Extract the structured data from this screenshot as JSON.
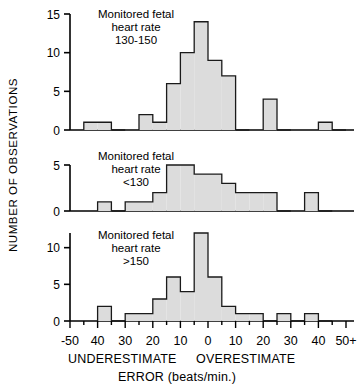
{
  "figure": {
    "ylabel": "NUMBER OF OBSERVATIONS",
    "xaxis_title": "ERROR (beats/min.)",
    "left_caption": "UNDERESTIMATE",
    "right_caption": "OVERESTIMATE",
    "xtick_labels": [
      "-50",
      "40",
      "30",
      "20",
      "10",
      "0",
      "10",
      "20",
      "30",
      "40",
      "50+"
    ],
    "bar_fill": "#dcdcdc",
    "bar_stroke": "#1a1a1a",
    "axis_color": "#000000"
  },
  "chart_data": {
    "type": "bar",
    "xlabel": "ERROR (beats/min.)",
    "ylabel": "NUMBER OF OBSERVATIONS",
    "xlim": [
      -50,
      50
    ],
    "bin_width": 5,
    "grid": false,
    "legend": "none",
    "panels": [
      {
        "id": "panel-130-150",
        "title_lines": [
          "Monitored fetal",
          "heart rate",
          "130-150"
        ],
        "ylim": [
          0,
          15
        ],
        "yticks": [
          0,
          5,
          10,
          15
        ],
        "bin_left_edges": [
          -50,
          -45,
          -40,
          -35,
          -30,
          -25,
          -20,
          -15,
          -10,
          -5,
          0,
          5,
          10,
          15,
          20,
          25,
          30,
          35,
          40,
          45
        ],
        "values": [
          0,
          1,
          1,
          0,
          0,
          2,
          1,
          6,
          10,
          14,
          9,
          7,
          0,
          0,
          4,
          0,
          0,
          0,
          1,
          0
        ]
      },
      {
        "id": "panel-under-130",
        "title_lines": [
          "Monitored fetal",
          "heart rate",
          "<130"
        ],
        "ylim": [
          0,
          5
        ],
        "yticks": [
          0,
          5
        ],
        "bin_left_edges": [
          -50,
          -45,
          -40,
          -35,
          -30,
          -25,
          -20,
          -15,
          -10,
          -5,
          0,
          5,
          10,
          15,
          20,
          25,
          30,
          35,
          40,
          45
        ],
        "values": [
          0,
          0,
          1,
          0,
          1,
          1,
          2,
          5,
          5,
          4,
          4,
          3,
          2,
          2,
          2,
          0,
          0,
          2,
          0,
          0
        ]
      },
      {
        "id": "panel-over-150",
        "title_lines": [
          "Monitored fetal",
          "heart rate",
          ">150"
        ],
        "ylim": [
          0,
          12
        ],
        "yticks": [
          0,
          5,
          10
        ],
        "bin_left_edges": [
          -50,
          -45,
          -40,
          -35,
          -30,
          -25,
          -20,
          -15,
          -10,
          -5,
          0,
          5,
          10,
          15,
          20,
          25,
          30,
          35,
          40,
          45
        ],
        "values": [
          0,
          0,
          2,
          0,
          1,
          1,
          3,
          6,
          4,
          12,
          6,
          2,
          1,
          1,
          0,
          1,
          0,
          1,
          0,
          0
        ]
      }
    ]
  }
}
